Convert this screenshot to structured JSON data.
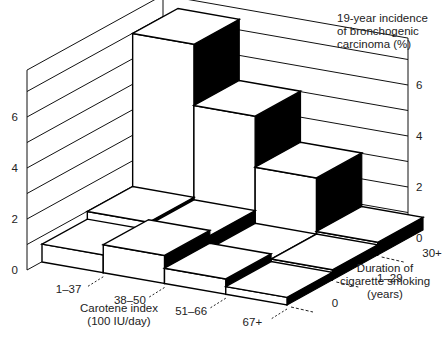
{
  "chart_data": {
    "type": "bar3d",
    "title": "19-year incidence of bronchogenic carcinoma (%)",
    "zlabel": "19-year incidence of bronchogenic carcinoma (%)",
    "xlabel": "Carotene index (100 IU/day)",
    "ylabel": "Duration of cigarette smoking (years)",
    "x_categories": [
      "1–37",
      "38–50",
      "51–66",
      "67+"
    ],
    "y_categories": [
      "0",
      "1–29",
      "30+"
    ],
    "z_ticks": [
      "0",
      "2",
      "4",
      "6"
    ],
    "zlim": [
      0,
      8
    ],
    "grid": true,
    "series": [
      {
        "name": "0",
        "values": [
          0.7,
          1.1,
          0.6,
          0.3
        ]
      },
      {
        "name": "1–29",
        "values": [
          1.0,
          0.9,
          0.4,
          0.4
        ]
      },
      {
        "name": "30+",
        "values": [
          7.0,
          4.6,
          2.6,
          0.5
        ]
      }
    ]
  },
  "labels": {
    "z_title_line1": "19-year incidence",
    "z_title_line2": "of bronchogenic",
    "z_title_line3": "carcinoma (%)",
    "x_title_line1": "Carotene index",
    "x_title_line2": "(100 IU/day)",
    "y_title_line1": "Duration of",
    "y_title_line2": "cigarette smoking",
    "y_title_line3": "(years)"
  }
}
